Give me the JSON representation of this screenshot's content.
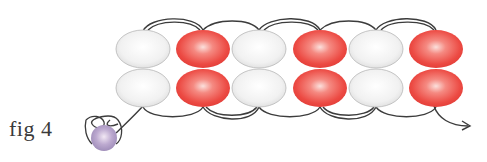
{
  "figure": {
    "label": "fig 4"
  },
  "colors": {
    "white_bead": "#f2f2f2",
    "white_bead_edge": "#b8b8b8",
    "red_bead": "#ee4a44",
    "red_bead_light": "#f8c8c0",
    "stop_bead": "#a896c2",
    "thread": "#3c3c3c"
  },
  "beads": {
    "columns": [
      {
        "color": "white"
      },
      {
        "color": "red"
      },
      {
        "color": "white"
      },
      {
        "color": "red"
      },
      {
        "color": "white"
      },
      {
        "color": "red"
      }
    ],
    "rows": 2,
    "stop_bead": {
      "color": "purple"
    }
  }
}
